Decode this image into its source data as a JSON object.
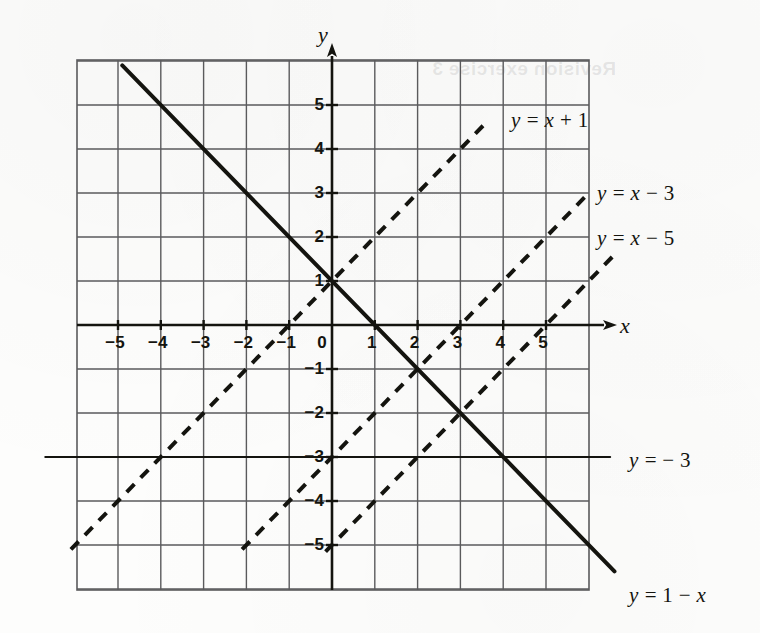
{
  "figure": {
    "background_color": "#fdfdfc",
    "ink_color": "#14140f",
    "grid_color": "#5a5a5c"
  },
  "page_bleed": [
    {
      "text": "Revision exercise 3",
      "x": 432,
      "y": 58
    }
  ],
  "axes": {
    "x_name": "x",
    "y_name": "y",
    "x_name_pos": {
      "x": 620,
      "y": 325
    },
    "y_name_pos": {
      "x": 318,
      "y": 30
    },
    "x_ticks": [
      {
        "value": -5,
        "label": "−5"
      },
      {
        "value": -4,
        "label": "−4"
      },
      {
        "value": -3,
        "label": "−3"
      },
      {
        "value": -2,
        "label": "−2"
      },
      {
        "value": -1,
        "label": "−1"
      },
      {
        "value": 0,
        "label": "0"
      },
      {
        "value": 1,
        "label": "1"
      },
      {
        "value": 2,
        "label": "2"
      },
      {
        "value": 3,
        "label": "3"
      },
      {
        "value": 4,
        "label": "4"
      },
      {
        "value": 5,
        "label": "5"
      }
    ],
    "y_ticks": [
      {
        "value": 5,
        "label": "5"
      },
      {
        "value": 4,
        "label": "4"
      },
      {
        "value": 3,
        "label": "3"
      },
      {
        "value": 2,
        "label": "2"
      },
      {
        "value": 1,
        "label": "1"
      },
      {
        "value": -1,
        "label": "−1"
      },
      {
        "value": -2,
        "label": "−2"
      },
      {
        "value": -3,
        "label": "−3"
      },
      {
        "value": -4,
        "label": "−4"
      },
      {
        "value": -5,
        "label": "−5"
      }
    ]
  },
  "chart_data": {
    "type": "line",
    "title": "",
    "xlabel": "x",
    "ylabel": "y",
    "xlim": [
      -6,
      6
    ],
    "ylim": [
      -6,
      6
    ],
    "grid": true,
    "grid_step": 1,
    "legend": "inline-labels",
    "series": [
      {
        "name": "y = 1 - x",
        "equation": "y = 1 - x",
        "slope": -1,
        "intercept": 1,
        "style": "solid",
        "line_width": 4,
        "label_text_parts": [
          "y",
          " = 1 − ",
          "x"
        ],
        "label_pos": {
          "x": 629,
          "y": 583
        },
        "x_from": -4.9,
        "x_to": 6.6
      },
      {
        "name": "y = x + 1",
        "equation": "y = x + 1",
        "slope": 1,
        "intercept": 1,
        "style": "dashed",
        "line_width": 4,
        "label_text_parts": [
          "y",
          " = ",
          "x",
          " + 1"
        ],
        "label_pos": {
          "x": 511,
          "y": 108
        },
        "x_from": -6.1,
        "x_to": 3.55
      },
      {
        "name": "y = x - 3",
        "equation": "y = x - 3",
        "slope": 1,
        "intercept": -3,
        "style": "dashed",
        "line_width": 4,
        "label_text_parts": [
          "y",
          " = ",
          "x",
          " − 3"
        ],
        "label_pos": {
          "x": 597,
          "y": 181
        },
        "x_from": -2.1,
        "x_to": 5.95
      },
      {
        "name": "y = x - 5",
        "equation": "y = x - 5",
        "slope": 1,
        "intercept": -5,
        "style": "dashed",
        "line_width": 4,
        "label_text_parts": [
          "y",
          " = ",
          "x",
          " − 5"
        ],
        "label_pos": {
          "x": 597,
          "y": 226
        },
        "x_from": -0.15,
        "x_to": 6.55
      },
      {
        "name": "y = -3",
        "equation": "y = -3",
        "slope": 0,
        "intercept": -3,
        "style": "solid",
        "line_width": 2,
        "label_text_parts": [
          "y",
          " = − 3"
        ],
        "label_pos": {
          "x": 629,
          "y": 448
        },
        "x_from": -6.7,
        "x_to": 6.5
      }
    ]
  },
  "geometry": {
    "origin_px": {
      "x": 332,
      "y": 325
    },
    "unit_px": {
      "x": 42.8,
      "y": 44.0
    },
    "grid_rect_px": {
      "left": 77,
      "top": 60,
      "right": 589,
      "bottom": 590
    }
  }
}
